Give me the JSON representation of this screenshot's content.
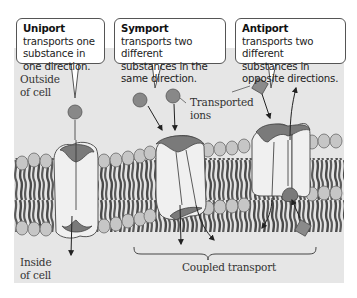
{
  "diagram": {
    "callouts": {
      "uniport": {
        "term": "Uniport",
        "text": " transports one substance in one direction."
      },
      "symport": {
        "term": "Symport",
        "text": " transports two different substances in the same direction."
      },
      "antiport": {
        "term": "Antiport",
        "text": " transports two different substances in opposite directions."
      }
    },
    "labels": {
      "outside_line1": "Outside",
      "outside_line2": "of cell",
      "inside_line1": "Inside",
      "inside_line2": "of cell",
      "transported_line1": "Transported",
      "transported_line2": "ions",
      "coupled_transport": "Coupled transport"
    },
    "colors": {
      "background": "#e6e6e6",
      "lipid_head": "#c4c4c4",
      "lipid_tail": "#505050",
      "protein_body": "#f2f2f2",
      "binding_site": "#7a7a7a",
      "ion": "#8a8a8a",
      "arrow": "#222222"
    }
  }
}
